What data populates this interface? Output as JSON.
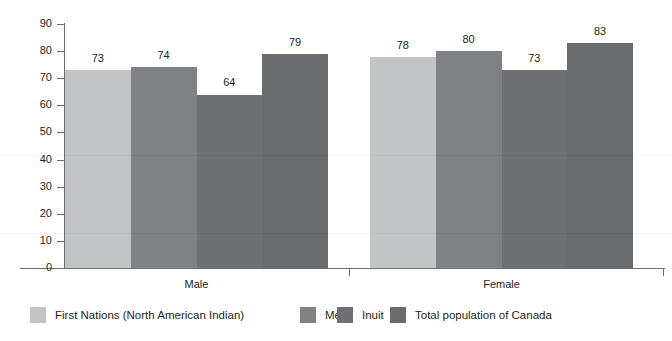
{
  "chart_data": {
    "type": "bar",
    "title": "",
    "subtitle": "",
    "xlabel": "",
    "ylabel": "",
    "categories": [
      "Male",
      "Female"
    ],
    "series": [
      {
        "name": "First Nations (North American Indian)",
        "values": [
          73,
          78
        ],
        "color": "#c3c4c6"
      },
      {
        "name": "Métis",
        "values": [
          74,
          80
        ],
        "color": "#808184"
      },
      {
        "name": "Inuit",
        "values": [
          64,
          73
        ],
        "color": "#6f7073"
      },
      {
        "name": "Total population of Canada",
        "values": [
          79,
          83
        ],
        "color": "#6a6b6e"
      }
    ],
    "ylim": [
      0,
      90
    ],
    "ytick_step": 10,
    "yticks": [
      "0",
      "10",
      "20",
      "30",
      "40",
      "50",
      "60",
      "70",
      "80",
      "90"
    ],
    "grid": false,
    "legend_position": "bottom",
    "data_labels": [
      "73",
      "74",
      "64",
      "79",
      "78",
      "80",
      "73",
      "83"
    ],
    "axis_color": "#6d6e71",
    "text_color": "#231f20",
    "background": "#ffffff"
  }
}
